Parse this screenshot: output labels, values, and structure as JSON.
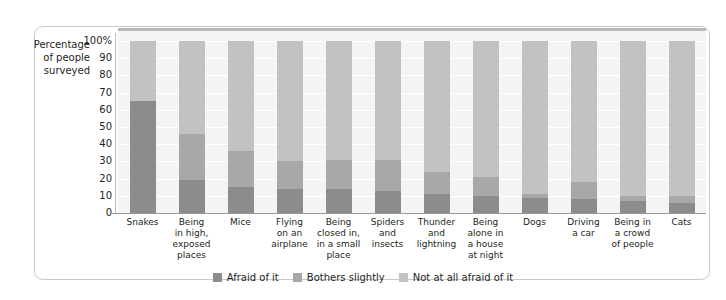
{
  "axis_title": "Percentage\nof people\nsurveyed",
  "colors": {
    "afraid": "#8c8c8c",
    "bothers": "#a8a8a8",
    "not_afraid": "#c2c2c2",
    "plot_background": "#f4f4f2",
    "gridline": "#ffffff",
    "frame_border": "#c9c9c9",
    "text": "#231f20"
  },
  "legend": {
    "items": [
      {
        "label": "Afraid of it",
        "color_key": "afraid",
        "swatch": "afraid-swatch"
      },
      {
        "label": "Bothers slightly",
        "color_key": "bothers",
        "swatch": "bothers-swatch"
      },
      {
        "label": "Not at all afraid of it",
        "color_key": "not_afraid",
        "swatch": "not-afraid-swatch"
      }
    ]
  },
  "chart_data": {
    "type": "bar",
    "subtype": "stacked-100-percent",
    "title": "",
    "xlabel": "",
    "ylabel": "Percentage of people surveyed",
    "ylim": [
      0,
      100
    ],
    "yticks": [
      0,
      10,
      20,
      30,
      40,
      50,
      60,
      70,
      80,
      90,
      100
    ],
    "ytick_labels": [
      "0",
      "10",
      "20",
      "30",
      "40",
      "50",
      "60",
      "70",
      "80",
      "90",
      "100%"
    ],
    "grid": true,
    "legend_position": "bottom-center",
    "categories": [
      "Snakes",
      "Being\nin high,\nexposed\nplaces",
      "Mice",
      "Flying\non an\nairplane",
      "Being\nclosed in,\nin a small\nplace",
      "Spiders\nand\ninsects",
      "Thunder\nand\nlightning",
      "Being\nalone in\na house\nat night",
      "Dogs",
      "Driving\na car",
      "Being in\na crowd\nof people",
      "Cats"
    ],
    "series": [
      {
        "name": "Afraid of it",
        "color": "#8c8c8c",
        "values": [
          65,
          19,
          15,
          14,
          14,
          13,
          11,
          10,
          9,
          8,
          7,
          6
        ]
      },
      {
        "name": "Bothers slightly",
        "color": "#a8a8a8",
        "values": [
          0,
          27,
          21,
          16,
          17,
          18,
          13,
          11,
          2,
          10,
          3,
          4
        ]
      },
      {
        "name": "Not at all afraid of it",
        "color": "#c2c2c2",
        "values": [
          35,
          54,
          64,
          70,
          69,
          69,
          76,
          79,
          89,
          82,
          90,
          90
        ]
      }
    ]
  }
}
